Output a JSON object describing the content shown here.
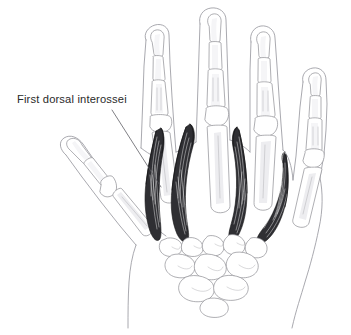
{
  "figure": {
    "background_color": "#ffffff",
    "width": 351,
    "height": 335
  },
  "annotations": [
    {
      "id": "first-dorsal-interossei",
      "label": "First dorsal interossei",
      "text_color": "#2a2a2a",
      "leader_from": [
        112,
        110
      ],
      "leader_to": [
        161,
        187
      ]
    }
  ],
  "label": {
    "first_dorsal_interossei": "First dorsal interossei"
  },
  "anatomy": {
    "view": "dorsal",
    "hand": "right",
    "muscle_color": "#2f2f33",
    "bone_outline_color": "#8d8d92",
    "skin_outline_color": "#9a9aa0",
    "structures": [
      "index finger",
      "middle finger",
      "ring finger",
      "little finger",
      "thumb",
      "metacarpals",
      "carpal bones",
      "first dorsal interosseous",
      "second dorsal interosseous",
      "third dorsal interosseous",
      "fourth dorsal interosseous"
    ],
    "muscle_count": 4
  }
}
